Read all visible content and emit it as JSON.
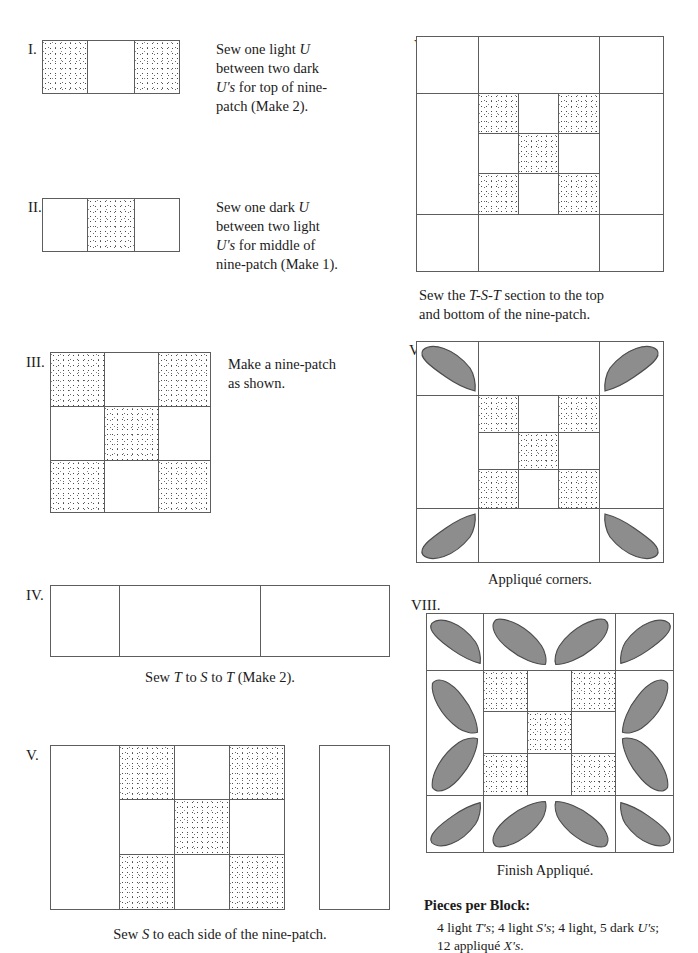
{
  "document": {
    "type": "quilt-block-instructions",
    "colors": {
      "ink": "#1b1b1b",
      "cell_outline": "#5d5d5d",
      "applique_fill": "#8d8d8d",
      "applique_stroke": "#4c4c4c",
      "light_fabric": "#ffffff"
    }
  },
  "steps": [
    {
      "numeral": "I.",
      "caption": "Sew one light U\nbetween two dark\nU's for top of nine-\npatch (Make 2).",
      "figure": "strip-dark-light-dark",
      "cells": [
        "dark",
        "light",
        "dark"
      ]
    },
    {
      "numeral": "II.",
      "caption": "Sew one dark U\nbetween two light\nU's for middle of\nnine-patch (Make 1).",
      "figure": "strip-light-dark-light",
      "cells": [
        "light",
        "dark",
        "light"
      ]
    },
    {
      "numeral": "III.",
      "caption": "Make a nine-patch\nas shown.",
      "figure": "nine-patch",
      "cells": [
        "dark",
        "light",
        "dark",
        "light",
        "dark",
        "light",
        "dark",
        "light",
        "dark"
      ]
    },
    {
      "numeral": "IV.",
      "caption": "Sew T to S to T (Make 2).",
      "figure": "t-s-t-strip",
      "cells": [
        "light",
        "light",
        "light"
      ]
    },
    {
      "numeral": "V.",
      "caption": "Sew S to each side of the nine-patch.",
      "figure": "nine-patch-with-sides",
      "cells": [
        "dark",
        "light",
        "dark",
        "light",
        "dark",
        "light",
        "dark",
        "light",
        "dark"
      ]
    },
    {
      "numeral": "VI.",
      "caption": "Sew the T-S-T section to the top\nand bottom of the nine-patch.",
      "figure": "full-block",
      "cells": [
        "dark",
        "light",
        "dark",
        "light",
        "dark",
        "light",
        "dark",
        "light",
        "dark"
      ]
    },
    {
      "numeral": "VII.",
      "caption": "Appliqué corners.",
      "figure": "block-with-corner-applique",
      "applique_count": 4
    },
    {
      "numeral": "VIII.",
      "caption": "Finish Appliqué.",
      "figure": "block-with-full-applique",
      "applique_count": 12
    }
  ],
  "pieces_per_block": {
    "title": "Pieces per Block:",
    "line1_pre": "4 light ",
    "line1_a": "T's",
    "line1_mid1": "; 4 light ",
    "line1_b": "S's",
    "line1_mid2": "; 4 light, 5 dark ",
    "line1_c": "U's",
    "line1_end": ";",
    "line2_pre": "12 appliqué ",
    "line2_a": "X's",
    "line2_end": "."
  }
}
